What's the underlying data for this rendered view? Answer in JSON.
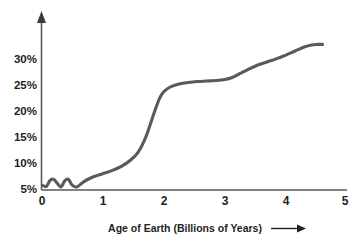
{
  "chart_data": {
    "type": "line",
    "title": "",
    "xlabel": "Age of Earth (Billions of Years)",
    "ylabel": "",
    "xlim": [
      0,
      5
    ],
    "ylim": [
      0,
      33
    ],
    "grid": false,
    "legend": null,
    "xticks": [
      "0",
      "1",
      "2",
      "3",
      "4",
      "5"
    ],
    "xtick_values": [
      0,
      1,
      2,
      3,
      4,
      5
    ],
    "yticks": [
      "5%",
      "10%",
      "15%",
      "20%",
      "25%",
      "30%"
    ],
    "ytick_values": [
      5,
      10,
      15,
      20,
      25,
      30
    ],
    "series": [
      {
        "name": "Atmospheric oxygen",
        "color": "#5a5a5c",
        "x": [
          0.02,
          0.08,
          0.14,
          0.2,
          0.26,
          0.32,
          0.38,
          0.44,
          0.5,
          0.58,
          0.7,
          0.85,
          1.0,
          1.15,
          1.3,
          1.45,
          1.58,
          1.7,
          1.8,
          1.88,
          1.94,
          2.0,
          2.06,
          2.14,
          2.25,
          2.4,
          2.55,
          2.7,
          2.85,
          3.0,
          3.12,
          3.25,
          3.4,
          3.55,
          3.7,
          3.85,
          4.0,
          4.15,
          4.3,
          4.42,
          4.52,
          4.6
        ],
        "y": [
          0.9,
          0.7,
          1.9,
          2.1,
          1.3,
          0.6,
          1.8,
          2.1,
          1.0,
          0.6,
          1.7,
          2.6,
          3.2,
          3.8,
          4.6,
          5.8,
          7.4,
          10.2,
          13.6,
          16.4,
          18.2,
          19.3,
          19.9,
          20.4,
          20.8,
          21.1,
          21.3,
          21.4,
          21.5,
          21.7,
          22.1,
          22.9,
          23.8,
          24.6,
          25.2,
          25.8,
          26.5,
          27.3,
          28.1,
          28.5,
          28.6,
          28.6
        ]
      }
    ],
    "annotations": {
      "y_axis_arrow": "up-arrow",
      "x_label_arrow": "right-arrow"
    },
    "colors": {
      "line": "#5a5a5c",
      "axis": "#58595b",
      "text": "#231f20",
      "background": "#ffffff"
    }
  }
}
